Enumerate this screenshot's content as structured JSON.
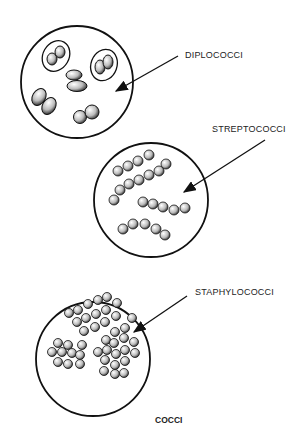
{
  "title": "COCCI",
  "labels": {
    "diplococci": "DIPLOCOCCI",
    "streptococci": "STREPTOCOCCI",
    "staphylococci": "STAPHYLOCOCCI"
  },
  "colors": {
    "line": "#111111",
    "background": "#ffffff",
    "cell_fill": "#dddddd"
  }
}
